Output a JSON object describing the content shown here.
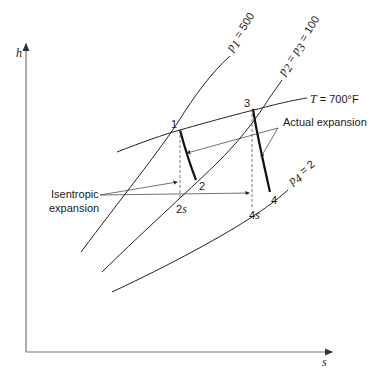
{
  "diagram": {
    "type": "h-s (Mollier) diagram, reheat steam turbine expansion",
    "axes": {
      "x_label": "s",
      "y_label": "h"
    },
    "isobars": [
      {
        "id": "p1",
        "label_var": "p",
        "label_sub": "1",
        "label_rest": " = 500"
      },
      {
        "id": "p2p3",
        "label_var": "p",
        "label_sub": "2",
        "label_mid": " = ",
        "label_var2": "p",
        "label_sub2": "3",
        "label_rest": " = 100"
      },
      {
        "id": "p4",
        "label_var": "p",
        "label_sub": "4",
        "label_rest": " = 2"
      }
    ],
    "isotherm": {
      "label_var": "T",
      "label_rest": " = 700°F"
    },
    "state_points": [
      {
        "id": "1",
        "label": "1"
      },
      {
        "id": "2",
        "label": "2"
      },
      {
        "id": "2s",
        "label_num": "2",
        "label_s": "s"
      },
      {
        "id": "3",
        "label": "3"
      },
      {
        "id": "4",
        "label": "4"
      },
      {
        "id": "4s",
        "label_num": "4",
        "label_s": "s"
      }
    ],
    "annotations": {
      "actual": "Actual expansion",
      "isentropic_line1": "Isentropic",
      "isentropic_line2": "expansion"
    }
  }
}
